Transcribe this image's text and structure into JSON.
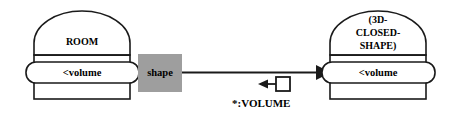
{
  "diagram": {
    "type": "semantic-network-frame-diagram",
    "background_color": "#ffffff",
    "line_color": "#1a1a1a",
    "nodes": [
      {
        "id": "room",
        "title": "ROOM",
        "slot_label": "<volume",
        "title_lines": [
          "ROOM"
        ]
      },
      {
        "id": "closed-shape",
        "title": "(3D-CLOSED-SHAPE)",
        "slot_label": "<volume",
        "title_lines": [
          "(3D-",
          "CLOSED-",
          "SHAPE)"
        ]
      }
    ],
    "shape_box": {
      "label": "shape",
      "fill_color": "#9e9e9e"
    },
    "edge": {
      "label": "*:VOLUME",
      "arrowhead": "solid-triangle-right",
      "marker": "boxed-arrow-left"
    }
  }
}
